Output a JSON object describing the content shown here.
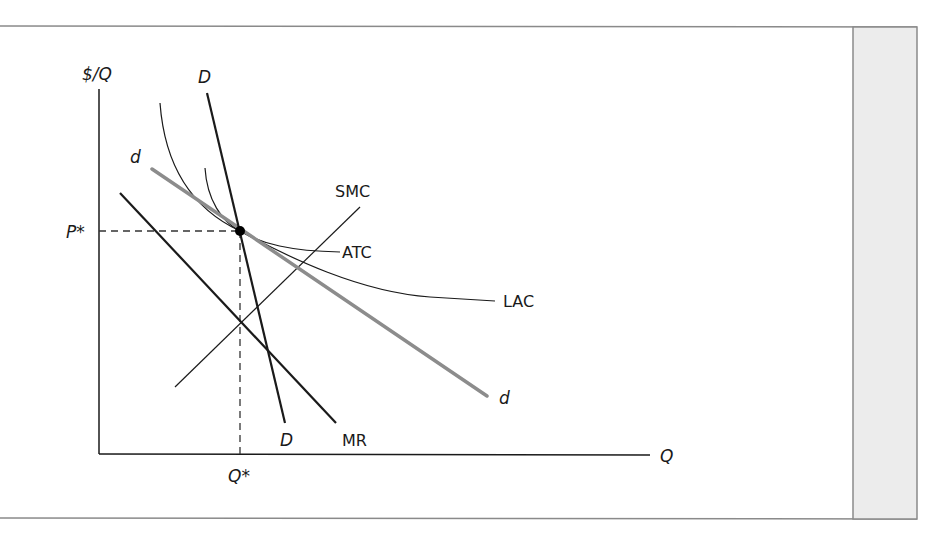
{
  "figure": {
    "frame_color": "#8a8a8a",
    "side_panel_color": "#ececec",
    "side_panel_border": "#8a8a8a"
  },
  "axes": {
    "y_label": "$/Q",
    "x_label": "Q",
    "p_star_label": "P*",
    "q_star_label": "Q*"
  },
  "curves": {
    "market_demand": {
      "label_top": "D",
      "label_bottom": "D",
      "color": "#1a1a1a"
    },
    "firm_demand": {
      "label_top": "d",
      "label_bottom": "d",
      "color": "#8c8c8c"
    },
    "marginal_revenue": {
      "label": "MR",
      "color": "#1a1a1a"
    },
    "short_run_marginal_cost": {
      "label": "SMC",
      "color": "#1a1a1a"
    },
    "average_total_cost": {
      "label": "ATC",
      "color": "#1a1a1a"
    },
    "long_run_average_cost": {
      "label": "LAC",
      "color": "#1a1a1a"
    }
  },
  "equilibrium": {
    "marker_color": "#000000"
  }
}
